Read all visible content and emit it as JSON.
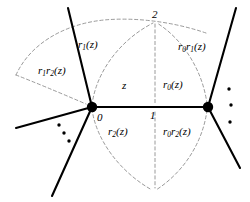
{
  "figure": {
    "kind": "mathematical-diagram",
    "background_color": "#ffffff",
    "solid_line_color": "#000000",
    "dashed_line_color": "#8a8a8a",
    "vertex_color": "#000000"
  },
  "vertices": [
    {
      "id": "v0",
      "label": "0",
      "x": 92,
      "y": 107
    },
    {
      "id": "v1",
      "label": "1",
      "x": 208,
      "y": 107
    }
  ],
  "points": [
    {
      "id": "p2",
      "label": "2",
      "x": 155,
      "y": 22
    }
  ],
  "region_labels": {
    "center": {
      "base": "z",
      "sub": "",
      "suffix": ""
    },
    "r0": {
      "base": "r",
      "sub": "0",
      "suffix": "(z)"
    },
    "r1": {
      "base": "r",
      "sub": "1",
      "suffix": "(z)"
    },
    "r2": {
      "base": "r",
      "sub": "2",
      "suffix": "(z)"
    },
    "r1r2": {
      "base1": "r",
      "sub1": "1",
      "base2": "r",
      "sub2": "2",
      "suffix": "(z)"
    },
    "r0r1": {
      "base1": "r",
      "sub1": "0",
      "base2": "r",
      "sub2": "1",
      "suffix": "(z)"
    },
    "r0r2": {
      "base1": "r",
      "sub1": "0",
      "base2": "r",
      "sub2": "2",
      "suffix": "(z)"
    }
  },
  "labels_plain": {
    "center": "z",
    "r0": "r0(z)",
    "r1": "r1(z)",
    "r2": "r2(z)",
    "r1r2": "r1r2(z)",
    "r0r1": "r0r1(z)",
    "r0r2": "r0r2(z)",
    "zero": "0",
    "one": "1",
    "two": "2"
  },
  "ellipses": [
    {
      "id": "dots-lower-left",
      "orientation": "diagonal",
      "count": 3,
      "x": 55,
      "y": 126
    },
    {
      "id": "dots-right",
      "orientation": "vertical",
      "count": 3,
      "x": 222,
      "y": 86
    }
  ]
}
